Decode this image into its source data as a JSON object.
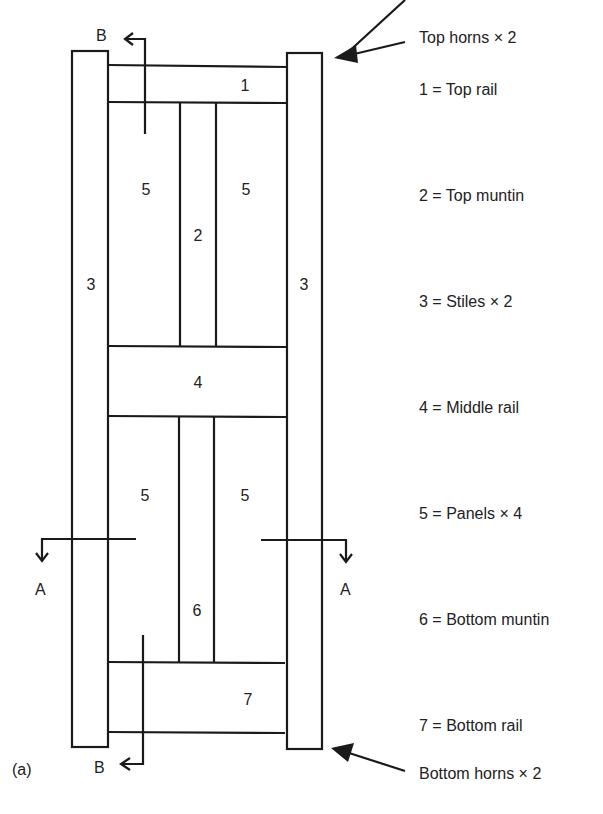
{
  "figure_label": "(a)",
  "section_marks": {
    "b_top": "B",
    "b_bottom": "B",
    "a_left": "A",
    "a_right": "A"
  },
  "part_numbers": {
    "top_rail": "1",
    "top_muntin": "2",
    "stile_left": "3",
    "stile_right": "3",
    "middle_rail": "4",
    "panel_top_left": "5",
    "panel_top_right": "5",
    "panel_bottom_left": "5",
    "panel_bottom_right": "5",
    "bottom_muntin": "6",
    "bottom_rail": "7"
  },
  "legend": [
    {
      "key": "top_horns",
      "text": "Top horns × 2"
    },
    {
      "key": "1",
      "text": "1 = Top rail"
    },
    {
      "key": "2",
      "text": "2 = Top muntin"
    },
    {
      "key": "3",
      "text": "3 = Stiles × 2"
    },
    {
      "key": "4",
      "text": "4 = Middle rail"
    },
    {
      "key": "5",
      "text": "5 = Panels × 4"
    },
    {
      "key": "6",
      "text": "6 = Bottom muntin"
    },
    {
      "key": "7",
      "text": "7 = Bottom rail"
    },
    {
      "key": "bottom_horns",
      "text": "Bottom horns × 2"
    }
  ]
}
